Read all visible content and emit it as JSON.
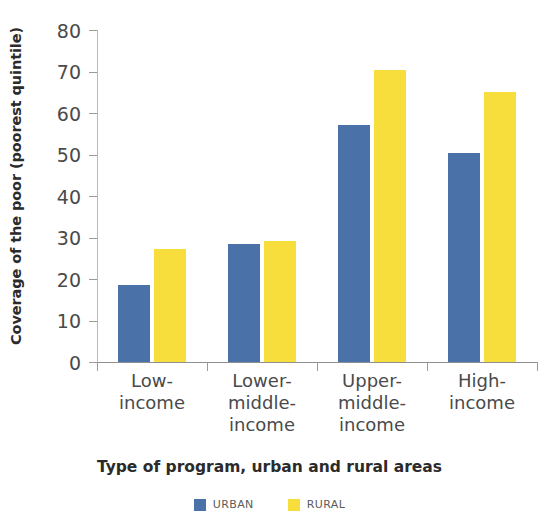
{
  "chart_data": {
    "type": "bar",
    "title": "",
    "xlabel": "Type of program, urban and rural areas",
    "ylabel": "Coverage of the poor (poorest quintile)",
    "categories": [
      "Low-\nincome",
      "Lower-\nmiddle-\nincome",
      "Upper-\nmiddle-\nincome",
      "High-\nincome"
    ],
    "series": [
      {
        "name": "URBAN",
        "color": "#4a72a8",
        "values": [
          18.5,
          28.5,
          57,
          50.3
        ]
      },
      {
        "name": "RURAL",
        "color": "#f7de3c",
        "values": [
          27.2,
          29.2,
          70.3,
          65
        ]
      }
    ],
    "ylim": [
      0,
      80
    ],
    "yticks": [
      0,
      10,
      20,
      30,
      40,
      50,
      60,
      70,
      80
    ],
    "ytick_labels": [
      "0",
      "10",
      "20",
      "30",
      "40",
      "50",
      "60",
      "70",
      "80"
    ],
    "grid": false,
    "legend_position": "bottom"
  },
  "legend": {
    "items": [
      {
        "label": "URBAN",
        "color": "#4a72a8"
      },
      {
        "label": "RURAL",
        "color": "#f7de3c"
      }
    ]
  }
}
